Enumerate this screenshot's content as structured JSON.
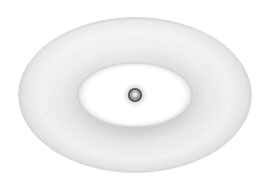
{
  "diagram": {
    "type": "torus-orbital",
    "background": "#ffffff",
    "torus": {
      "cx": 135,
      "cy": 95,
      "outer_rx": 117,
      "outer_ry": 78,
      "inner_rx": 56,
      "inner_ry": 31,
      "fill_light": "#f7f7f7",
      "fill_mid": "#e6e6e6",
      "fill_shadow": "#c9c9c9"
    },
    "nucleus": {
      "cx": 135,
      "cy": 95,
      "halo_r": 14,
      "ring_r": 6,
      "core_r": 3,
      "ring_color": "#555555",
      "halo_color": "#9a9a9a",
      "core_color": "#f2f2f2"
    }
  }
}
